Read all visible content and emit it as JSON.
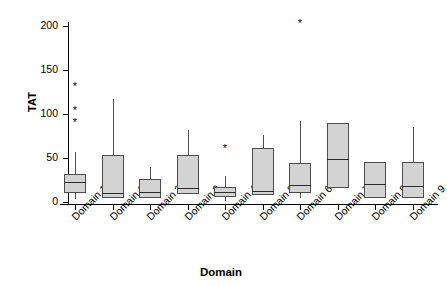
{
  "chart_data": {
    "type": "box",
    "title": "",
    "xlabel": "Domain",
    "ylabel": "TAT",
    "ylim": [
      0,
      215
    ],
    "yticks": [
      0,
      50,
      100,
      150,
      200
    ],
    "grid": false,
    "legend": null,
    "categories": [
      "Domain 10",
      "Domain 11",
      "Domain 2",
      "Domain 3",
      "Domain 4",
      "Domain 5",
      "Domain 6",
      "Domain 7",
      "Domain 8",
      "Domain 9"
    ],
    "boxes": [
      {
        "category": "Domain 10",
        "whisker_low": 3,
        "q1": 10,
        "median": 23,
        "q3": 32,
        "whisker_high": 57,
        "outliers": [
          91,
          105,
          132
        ]
      },
      {
        "category": "Domain 11",
        "whisker_low": 5,
        "q1": 5,
        "median": 10,
        "q3": 53,
        "whisker_high": 117,
        "outliers": []
      },
      {
        "category": "Domain 2",
        "whisker_low": 5,
        "q1": 5,
        "median": 11,
        "q3": 26,
        "whisker_high": 40,
        "outliers": []
      },
      {
        "category": "Domain 3",
        "whisker_low": 9,
        "q1": 9,
        "median": 16,
        "q3": 53,
        "whisker_high": 82,
        "outliers": []
      },
      {
        "category": "Domain 4",
        "whisker_low": 1,
        "q1": 6,
        "median": 11,
        "q3": 17,
        "whisker_high": 30,
        "outliers": [
          61
        ]
      },
      {
        "category": "Domain 5",
        "whisker_low": 8,
        "q1": 8,
        "median": 13,
        "q3": 61,
        "whisker_high": 76,
        "outliers": []
      },
      {
        "category": "Domain 6",
        "whisker_low": 4,
        "q1": 10,
        "median": 19,
        "q3": 44,
        "whisker_high": 92,
        "outliers": [
          203
        ]
      },
      {
        "category": "Domain 7",
        "whisker_low": 16,
        "q1": 16,
        "median": 49,
        "q3": 90,
        "whisker_high": 90,
        "outliers": []
      },
      {
        "category": "Domain 8",
        "whisker_low": 4,
        "q1": 4,
        "median": 20,
        "q3": 45,
        "whisker_high": 45,
        "outliers": []
      },
      {
        "category": "Domain 9",
        "whisker_low": 4,
        "q1": 4,
        "median": 18,
        "q3": 45,
        "whisker_high": 85,
        "outliers": []
      }
    ],
    "colors": {
      "box_fill": "#d3d3d3",
      "box_edge": "#4d4d4d",
      "median": "#2b2b2b",
      "axis": "#000000",
      "background": "#ffffff"
    },
    "outlier_marker": "*"
  }
}
